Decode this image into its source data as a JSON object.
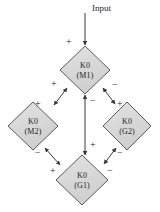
{
  "diagram": {
    "title": "Input",
    "type": "signed-feedback-network",
    "input": {
      "label": "Input",
      "sign": "+",
      "target": "M1"
    },
    "nodes": [
      {
        "id": "M1",
        "line1": "K0",
        "line2": "(M1)",
        "cx": 85,
        "cy": 70,
        "rx": 25,
        "ry": 24
      },
      {
        "id": "M2",
        "line1": "K0",
        "line2": "(M2)",
        "cx": 33,
        "cy": 126,
        "rx": 25,
        "ry": 24
      },
      {
        "id": "G2",
        "line1": "K0",
        "line2": "(G2)",
        "cx": 127,
        "cy": 126,
        "rx": 24,
        "ry": 24
      },
      {
        "id": "G1",
        "line1": "K0",
        "line2": "(G1)",
        "cx": 82,
        "cy": 180,
        "rx": 26,
        "ry": 25
      }
    ],
    "edges": [
      {
        "from": "M1",
        "to": "M2",
        "bidirectional": true,
        "sign_at_from": "+",
        "sign_at_to": "+"
      },
      {
        "from": "M1",
        "to": "G2",
        "bidirectional": true,
        "sign_at_from": "-",
        "sign_at_to": "+"
      },
      {
        "from": "M1",
        "to": "G1",
        "bidirectional": true,
        "sign_at_from": "-",
        "sign_at_to": "+"
      },
      {
        "from": "M2",
        "to": "G1",
        "bidirectional": true,
        "sign_at_from": "-",
        "sign_at_to": "+"
      },
      {
        "from": "G2",
        "to": "G1",
        "bidirectional": true,
        "sign_at_from": "-",
        "sign_at_to": "-"
      }
    ],
    "signs": {
      "input_plus": "+",
      "m1_upper_left_plus": "+",
      "m1_right_minus": "−",
      "m1_below_minus": "−",
      "m2_upper_right_plus": "+",
      "m2_lower_right_minus": "−",
      "g2_upper_left_plus": "+",
      "g2_lower_left_minus": "−",
      "g1_above_plus": "+",
      "g1_left_plus": "+",
      "g1_right_minus": "−"
    },
    "style": {
      "node_fill": "#d9d9d9",
      "node_stroke": "#4a4a4a",
      "edge_color": "#3a3a3a",
      "background": "#ffffff",
      "text_color": "#1f1f1f"
    }
  }
}
